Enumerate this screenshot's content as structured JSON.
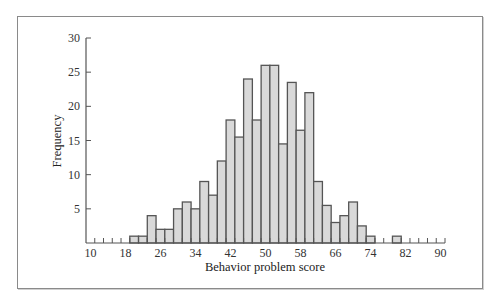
{
  "chart_data": {
    "type": "bar",
    "subtype": "histogram",
    "title": "",
    "xlabel": "Behavior problem score",
    "ylabel": "Frequency",
    "bin_width": 2,
    "bin_centers": [
      20,
      22,
      24,
      26,
      28,
      30,
      32,
      34,
      36,
      38,
      40,
      42,
      44,
      46,
      48,
      50,
      52,
      54,
      56,
      58,
      60,
      62,
      64,
      66,
      68,
      70,
      72,
      74,
      76,
      78,
      80
    ],
    "values": [
      1,
      1,
      4,
      2,
      2,
      5,
      6,
      5,
      9,
      7,
      12,
      18,
      15.5,
      24,
      18,
      26,
      26,
      14.5,
      23.5,
      16.5,
      22,
      9,
      5.5,
      3,
      4,
      6,
      2.5,
      1,
      0,
      0,
      1
    ],
    "xlim": [
      9,
      91
    ],
    "ylim": [
      0,
      30
    ],
    "x_ticks": [
      "10",
      "18",
      "26",
      "34",
      "42",
      "50",
      "58",
      "66",
      "74",
      "82",
      "90"
    ],
    "x_tick_values": [
      10,
      18,
      26,
      34,
      42,
      50,
      58,
      66,
      74,
      82,
      90
    ],
    "y_ticks": [
      "5",
      "10",
      "15",
      "20",
      "25",
      "30"
    ],
    "y_tick_values": [
      5,
      10,
      15,
      20,
      25,
      30
    ],
    "grid": false,
    "legend": null,
    "colors": {
      "bar_fill": "#d9d9d9",
      "bar_edge": "#555555",
      "axis": "#555555",
      "frame": "#8a8a8a"
    }
  }
}
